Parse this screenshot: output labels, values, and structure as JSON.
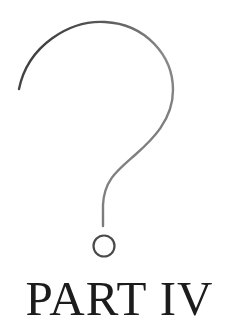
{
  "page": {
    "title": "PART IV",
    "illustration": {
      "icon": "question-mark-icon",
      "stroke_color_start": "#2e2e2e",
      "stroke_color_end": "#8a8a8a"
    },
    "background_color": "#ffffff",
    "text_color": "#1c1c1c"
  }
}
